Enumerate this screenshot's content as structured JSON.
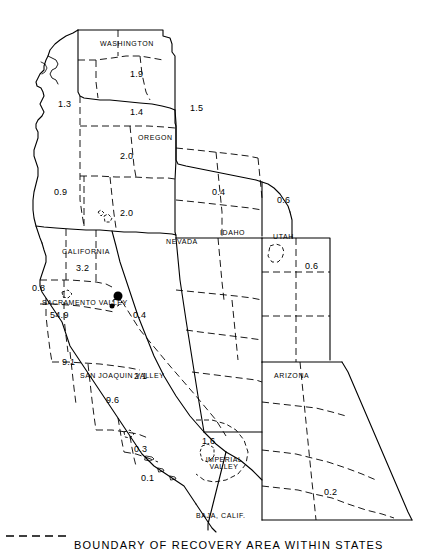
{
  "map": {
    "title": "",
    "states": [
      {
        "name": "WASHINGTON",
        "x": 100,
        "y": 40
      },
      {
        "name": "OREGON",
        "x": 138,
        "y": 134
      },
      {
        "name": "CALIFORNIA",
        "x": 62,
        "y": 248
      },
      {
        "name": "NEVADA",
        "x": 166,
        "y": 238
      },
      {
        "name": "IDAHO",
        "x": 220,
        "y": 229
      },
      {
        "name": "UTAH",
        "x": 273,
        "y": 233
      },
      {
        "name": "ARIZONA",
        "x": 274,
        "y": 372
      },
      {
        "name": "BAJA, CALIF.",
        "x": 196,
        "y": 512
      }
    ],
    "regions": [
      {
        "name": "SACRAMENTO VALLEY",
        "x": 42,
        "y": 299
      },
      {
        "name": "SAN JOAQUIN VALLEY",
        "x": 80,
        "y": 372
      },
      {
        "name": "IMPERIAL VALLEY",
        "x": 205,
        "y": 456
      }
    ],
    "values": [
      {
        "value": "1.9",
        "x": 130,
        "y": 70
      },
      {
        "value": "1.3",
        "x": 58,
        "y": 100
      },
      {
        "value": "1.4",
        "x": 130,
        "y": 108
      },
      {
        "value": "1.5",
        "x": 190,
        "y": 104
      },
      {
        "value": "2.0",
        "x": 120,
        "y": 152
      },
      {
        "value": "0.9",
        "x": 54,
        "y": 188
      },
      {
        "value": "2.0",
        "x": 120,
        "y": 209
      },
      {
        "value": "0.4",
        "x": 212,
        "y": 188
      },
      {
        "value": "0.6",
        "x": 277,
        "y": 196
      },
      {
        "value": "3.2",
        "x": 76,
        "y": 264
      },
      {
        "value": "0.6",
        "x": 305,
        "y": 262
      },
      {
        "value": "0.8",
        "x": 32,
        "y": 284
      },
      {
        "value": "54.9",
        "x": 50,
        "y": 311
      },
      {
        "value": "0.4",
        "x": 133,
        "y": 311
      },
      {
        "value": "9.1",
        "x": 62,
        "y": 358
      },
      {
        "value": "2.1",
        "x": 134,
        "y": 372
      },
      {
        "value": "9.6",
        "x": 106,
        "y": 396
      },
      {
        "value": "0.3",
        "x": 134,
        "y": 445
      },
      {
        "value": "1.6",
        "x": 202,
        "y": 437
      },
      {
        "value": "0.1",
        "x": 141,
        "y": 474
      },
      {
        "value": "0.2",
        "x": 324,
        "y": 488
      }
    ],
    "legend": {
      "text": "BOUNDARY OF RECOVERY AREA WITHIN STATES",
      "dash_pattern": "8 5"
    }
  }
}
